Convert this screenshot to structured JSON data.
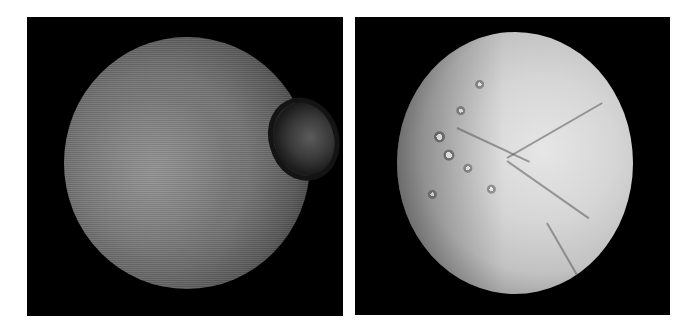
{
  "figure": {
    "panels": [
      {
        "id": "left",
        "subject": "moon-photo-grayscale-grainy",
        "features": [
          "large-crater-upper-right-limb",
          "terminator-right-side"
        ],
        "colors": {
          "background": "#000000",
          "surface": "#7a7a7a"
        }
      },
      {
        "id": "right",
        "subject": "moon-photo-bright-icy",
        "features": [
          "cratered-left-hemisphere",
          "smooth-fractured-right-hemisphere"
        ],
        "colors": {
          "background": "#000000",
          "surface": "#d6d6d6"
        }
      }
    ],
    "page_background": "#ffffff"
  }
}
